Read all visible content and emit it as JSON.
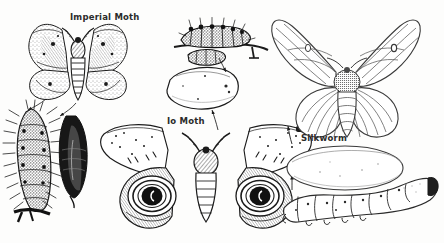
{
  "plate": {
    "kind": "scientific-illustration",
    "medium": "black-and-white pen-and-ink line engraving",
    "subject": "Moth life stages comparison plate",
    "background_color": "#fdfdfc",
    "ink_color": "#1b1b1b",
    "width": 444,
    "height": 243
  },
  "labels": {
    "imperial_moth": "Imperial Moth",
    "io_moth": "Io Moth",
    "silkworm": "Silkworm"
  },
  "specimens": [
    {
      "id": "imperial-moth-adult",
      "label": "Imperial Moth",
      "stage": "adult",
      "position": "top-left",
      "description": "Large moth with wings spread flat, mottled speckled forewings and hindwings, feathery antennae, banded abdomen"
    },
    {
      "id": "imperial-moth-larva",
      "label": "",
      "stage": "larva",
      "position": "lower-left",
      "description": "Dark hairy spiny caterpillar shown vertically clinging to a twig"
    },
    {
      "id": "imperial-moth-pupa",
      "label": "",
      "stage": "pupa",
      "position": "lower-left-right-of-larva",
      "description": "Dark elongated pupa / chrysalis"
    },
    {
      "id": "io-moth-larva",
      "label": "",
      "stage": "larva",
      "position": "top-center",
      "description": "Dark bristly spined caterpillar resting on a horizontal twig"
    },
    {
      "id": "io-moth-cocoon",
      "label": "",
      "stage": "cocoon",
      "position": "center",
      "description": "Rounded oval cocoon with leader arrows above and below"
    },
    {
      "id": "io-moth-adult",
      "label": "Io Moth",
      "stage": "adult",
      "position": "bottom-center",
      "description": "Moth with wings spread, large dark eyespots with concentric rings on each hindwing, dashed markings on forewings"
    },
    {
      "id": "silkworm-moth-adult",
      "label": "",
      "stage": "adult",
      "position": "top-right",
      "description": "Pale silkworm moth with upswept striped forewings, fan-shaped hindwings and stout banded abdomen"
    },
    {
      "id": "silkworm-cocoon",
      "label": "Silkworm",
      "stage": "cocoon",
      "position": "right-middle",
      "description": "Large pale oval silk cocoon"
    },
    {
      "id": "silkworm-larva",
      "label": "",
      "stage": "larva",
      "position": "bottom-right",
      "description": "Pale segmented silkworm caterpillar in profile, head raised at right"
    }
  ],
  "leader_lines": [
    {
      "id": "imperial-to-larva",
      "from": "imperial-moth-adult",
      "to": "imperial-moth-larva"
    },
    {
      "id": "imperial-to-pupa",
      "from": "imperial-moth-adult",
      "to": "imperial-moth-pupa"
    },
    {
      "id": "io-larva-to-cocoon",
      "from": "io-moth-larva",
      "to": "io-moth-cocoon"
    },
    {
      "id": "io-adult-to-cocoon",
      "from": "io-moth-adult",
      "to": "io-moth-cocoon"
    },
    {
      "id": "silkworm-cocoon-to-adult",
      "from": "silkworm-cocoon",
      "to": "silkworm-moth-adult"
    },
    {
      "id": "silkworm-larva-to-cocoon",
      "from": "silkworm-larva",
      "to": "silkworm-cocoon"
    }
  ]
}
